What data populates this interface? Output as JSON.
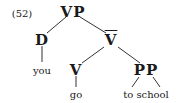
{
  "example_number": "(52)",
  "tree": {
    "root": "VP",
    "nodes": {
      "vp": "VP",
      "d": "D",
      "vbar": "V",
      "v": "V",
      "pp": "PP"
    },
    "leaves": {
      "you": "you",
      "go": "go",
      "to_school": "to school"
    }
  }
}
